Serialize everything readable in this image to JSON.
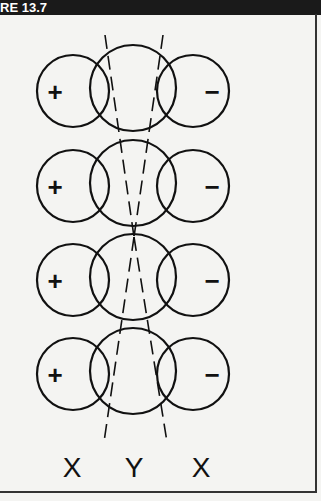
{
  "header": {
    "title": "RE 13.7"
  },
  "diagram": {
    "rows": [
      {
        "left_sign": "+",
        "right_sign": "−"
      },
      {
        "left_sign": "+",
        "right_sign": "−"
      },
      {
        "left_sign": "+",
        "right_sign": "−"
      },
      {
        "left_sign": "+",
        "right_sign": "−"
      }
    ],
    "labels": [
      "X",
      "Y",
      "X"
    ]
  }
}
